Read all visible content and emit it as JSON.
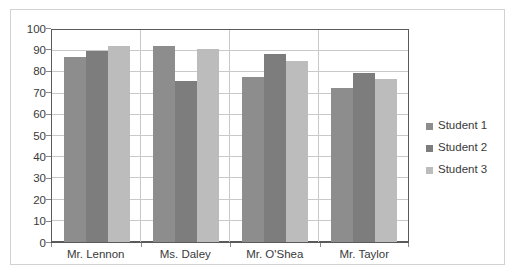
{
  "chart_data": {
    "type": "bar",
    "title": "",
    "xlabel": "",
    "ylabel": "",
    "ylim": [
      0,
      100
    ],
    "yticks": [
      100,
      90,
      80,
      70,
      60,
      50,
      40,
      30,
      20,
      10,
      0
    ],
    "grid": true,
    "legend_position": "right",
    "categories": [
      "Mr. Lennon",
      "Ms. Daley",
      "Mr. O'Shea",
      "Mr. Taylor"
    ],
    "series": [
      {
        "name": "Student 1",
        "color": "#8d8d8d",
        "values": [
          87.5,
          92.5,
          78,
          72.5
        ]
      },
      {
        "name": "Student 2",
        "color": "#7d7d7d",
        "values": [
          90,
          76,
          88.5,
          79.5
        ]
      },
      {
        "name": "Student 3",
        "color": "#bcbcbc",
        "values": [
          92.5,
          91,
          85.5,
          77
        ]
      }
    ]
  },
  "legend": {
    "items": [
      {
        "label": "Student 1"
      },
      {
        "label": "Student 2"
      },
      {
        "label": "Student 3"
      }
    ]
  }
}
